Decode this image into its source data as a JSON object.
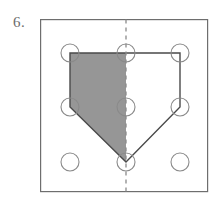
{
  "figure": {
    "problem_number": "6.",
    "canvas": {
      "width": 221,
      "height": 205,
      "background": "#ffffff"
    },
    "frame": {
      "x": 40,
      "y": 19,
      "width": 168,
      "height": 173,
      "stroke": "#6e6e6e",
      "stroke_width": 1.2,
      "fill": "#ffffff"
    },
    "grid_dots": {
      "radius": 9,
      "stroke": "#8a8a8a",
      "stroke_width": 1.1,
      "fill": "none",
      "columns_x": [
        70,
        126,
        180
      ],
      "rows_y": [
        53,
        107,
        162
      ],
      "points": [
        {
          "id": "dot-r1c1",
          "cx": 70,
          "cy": 53
        },
        {
          "id": "dot-r1c2",
          "cx": 126,
          "cy": 53
        },
        {
          "id": "dot-r1c3",
          "cx": 180,
          "cy": 53
        },
        {
          "id": "dot-r2c1",
          "cx": 70,
          "cy": 107
        },
        {
          "id": "dot-r2c2",
          "cx": 126,
          "cy": 107
        },
        {
          "id": "dot-r2c3",
          "cx": 180,
          "cy": 107
        },
        {
          "id": "dot-r3c1",
          "cx": 70,
          "cy": 162
        },
        {
          "id": "dot-r3c2",
          "cx": 126,
          "cy": 162
        },
        {
          "id": "dot-r3c3",
          "cx": 180,
          "cy": 162
        }
      ]
    },
    "shaded_half": {
      "label": "left-shaded-half",
      "points": "70,53 126,53 126,162 70,107",
      "fill": "#969696",
      "stroke": "#4a4a4a",
      "stroke_width": 1.4
    },
    "unshaded_half": {
      "label": "right-unshaded-half",
      "points": "126,53 180,53 180,107 126,162",
      "fill": "#ffffff",
      "stroke": "#4a4a4a",
      "stroke_width": 1.4
    },
    "outline": {
      "label": "pentagon-outline",
      "points": "70,53 180,53 180,107 126,162 70,107",
      "stroke": "#4a4a4a",
      "stroke_width": 1.4,
      "fill": "none"
    },
    "symmetry_line": {
      "label": "vertical-dashed-line-of-symmetry",
      "x": 126,
      "y1": 19,
      "y2": 192,
      "stroke": "#8a8a8a",
      "stroke_width": 1.3,
      "dash": "4 4"
    }
  }
}
